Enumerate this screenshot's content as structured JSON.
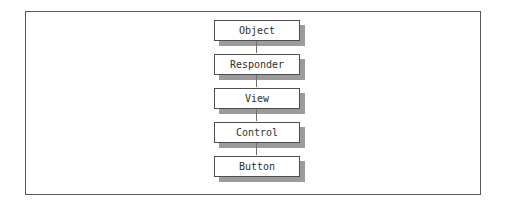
{
  "figure": {
    "kind": "class-hierarchy-diagram",
    "frame": {
      "border_color": "#59595c",
      "background": "#ffffff"
    },
    "box_style": {
      "fill": "#ffffff",
      "border_color": "#4d4d50",
      "shadow_color": "#9b9b9e",
      "text_color": "#2e2e30"
    },
    "connector_color": "#6e6e72",
    "nodes": [
      {
        "label": "Object"
      },
      {
        "label": "Responder"
      },
      {
        "label": "View"
      },
      {
        "label": "Control"
      },
      {
        "label": "Button"
      }
    ]
  }
}
